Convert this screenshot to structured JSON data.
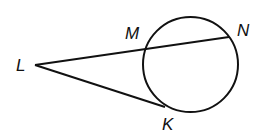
{
  "diagram": {
    "type": "circle with secant and tangent from external point",
    "stroke_color": "#111111",
    "circle": {
      "cx": 190.5,
      "cy": 64.5,
      "r": 47.5
    },
    "points": {
      "L": {
        "label": "L",
        "x": 35,
        "y": 65
      },
      "M": {
        "label": "M",
        "x": 144,
        "y": 50
      },
      "N": {
        "label": "N",
        "x": 229,
        "y": 37
      },
      "K": {
        "label": "K",
        "x": 165,
        "y": 107
      }
    },
    "segments": [
      {
        "from": "L",
        "to": "N",
        "name": "secant LN through M"
      },
      {
        "from": "L",
        "to": "K",
        "name": "tangent LK"
      }
    ]
  }
}
